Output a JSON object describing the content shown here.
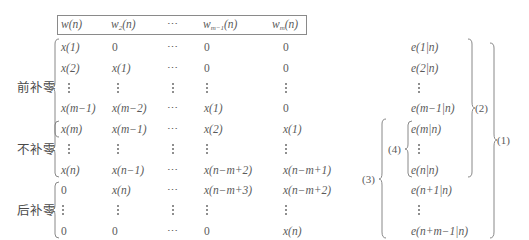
{
  "header": {
    "columns": [
      "w(n)",
      "w₂(n)",
      "⋯",
      "w_{m−1}(n)",
      "w_m(n)"
    ],
    "col0": "w(n)",
    "col1_base": "w",
    "col1_sub": "2",
    "col1_tail": "(n)",
    "col2": "⋯",
    "col3_base": "w",
    "col3_sub": "m−1",
    "col3_tail": "(n)",
    "col4_base": "w",
    "col4_sub": "m",
    "col4_tail": "(n)"
  },
  "groups": {
    "pre": {
      "label": "前补零"
    },
    "none": {
      "label": "不补零"
    },
    "post": {
      "label": "后补零"
    }
  },
  "matrix": {
    "rows": [
      [
        "x(1)",
        "0",
        "⋯",
        "0",
        "0"
      ],
      [
        "x(2)",
        "x(1)",
        "⋯",
        "0",
        "0"
      ],
      [
        "⋮",
        "⋮",
        "⋮",
        "⋮",
        "⋮"
      ],
      [
        "x(m−1)",
        "x(m−2)",
        "⋯",
        "x(1)",
        "0"
      ],
      [
        "x(m)",
        "x(m−1)",
        "⋯",
        "x(2)",
        "x(1)"
      ],
      [
        "⋮",
        "⋮",
        "⋮",
        "⋮",
        "⋮"
      ],
      [
        "x(n)",
        "x(n−1)",
        "⋯",
        "x(n−m+2)",
        "x(n−m+1)"
      ],
      [
        "0",
        "x(n)",
        "⋯",
        "x(n−m+3)",
        "x(n−m+2)"
      ],
      [
        "⋮",
        "⋮",
        "⋮",
        "⋮",
        "⋮"
      ],
      [
        "0",
        "0",
        "⋯",
        "0",
        "x(n)"
      ]
    ]
  },
  "errors": {
    "items": [
      "e(1|n)",
      "e(2|n)",
      "⋮",
      "e(m−1|n)",
      "e(m|n)",
      "⋮",
      "e(n|n)",
      "e(n+1|n)",
      "⋮",
      "e(n+m−1|n)"
    ]
  },
  "braces": {
    "b1": "(1)",
    "b2": "(2)",
    "b3": "(3)",
    "b4": "(4)"
  }
}
